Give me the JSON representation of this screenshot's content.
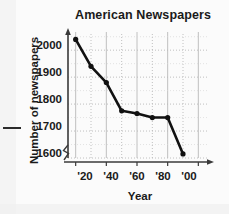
{
  "chart_data": {
    "type": "line",
    "title": "American Newspapers",
    "xlabel": "Year",
    "ylabel": "Number of newspapers",
    "x": [
      1920,
      1930,
      1940,
      1950,
      1960,
      1970,
      1980,
      1990
    ],
    "values": [
      2040,
      1940,
      1880,
      1775,
      1765,
      1750,
      1750,
      1615
    ],
    "xtick_labels": [
      "'20",
      "'40",
      "'60",
      "'80",
      "'00"
    ],
    "xtick_values": [
      1920,
      1940,
      1960,
      1980,
      2000
    ],
    "ytick_labels": [
      "1600",
      "1700",
      "1800",
      "1900",
      "2000"
    ],
    "ytick_values": [
      1600,
      1700,
      1800,
      1900,
      2000
    ],
    "xlim": [
      1915,
      2005
    ],
    "ylim": [
      1600,
      2060
    ],
    "grid": true,
    "grid_style": "dotted",
    "y_axis_break": true,
    "legend": null,
    "marker": "filled-circle",
    "line_color": "#111111",
    "grid_color": "#b9b9b9",
    "axis_color": "#3a3a3a"
  }
}
